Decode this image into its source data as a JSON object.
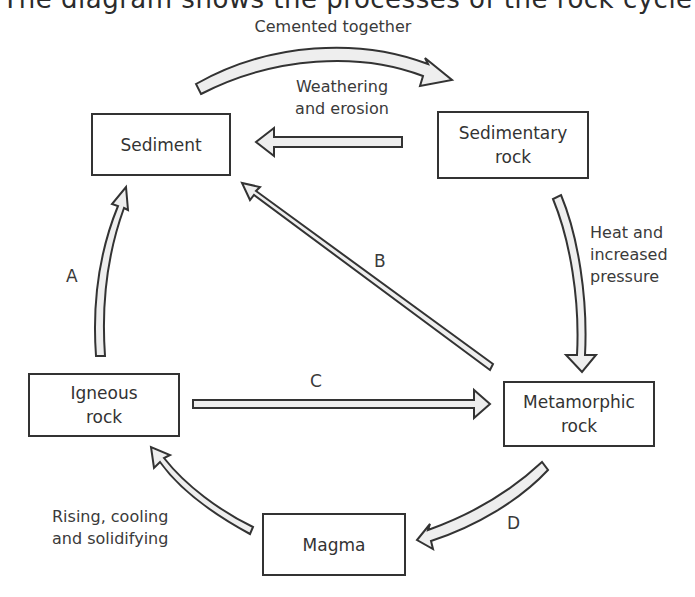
{
  "title": "The diagram shows the processes of the rock cycle",
  "nodes": {
    "sediment": {
      "lines": [
        "Sediment"
      ]
    },
    "sedimentary_rock": {
      "lines": [
        "Sedimentary",
        "rock"
      ]
    },
    "metamorphic_rock": {
      "lines": [
        "Metamorphic",
        "rock"
      ]
    },
    "magma": {
      "lines": [
        "Magma"
      ]
    },
    "igneous_rock": {
      "lines": [
        "Igneous",
        "rock"
      ]
    }
  },
  "process_labels": {
    "cemented": "Cemented together",
    "weathering": [
      "Weathering",
      "and erosion"
    ],
    "heat": [
      "Heat and",
      "increased",
      "pressure"
    ],
    "rising": [
      "Rising, cooling",
      "and solidifying"
    ]
  },
  "unknown_labels": {
    "a": "A",
    "b": "B",
    "c": "C",
    "d": "D"
  },
  "arrows": [
    {
      "from": "Sediment",
      "to": "Sedimentary rock",
      "label": "Cemented together"
    },
    {
      "from": "Sedimentary rock",
      "to": "Sediment",
      "label": "Weathering and erosion"
    },
    {
      "from": "Sedimentary rock",
      "to": "Metamorphic rock",
      "label": "Heat and increased pressure"
    },
    {
      "from": "Metamorphic rock",
      "to": "Sediment",
      "label": "B"
    },
    {
      "from": "Igneous rock",
      "to": "Metamorphic rock",
      "label": "C"
    },
    {
      "from": "Metamorphic rock",
      "to": "Magma",
      "label": "D"
    },
    {
      "from": "Magma",
      "to": "Igneous rock",
      "label": "Rising, cooling and solidifying"
    },
    {
      "from": "Igneous rock",
      "to": "Sediment",
      "label": "A"
    }
  ],
  "colors": {
    "stroke": "#333333",
    "arrow_fill": "#eeeeee",
    "background": "#ffffff"
  }
}
